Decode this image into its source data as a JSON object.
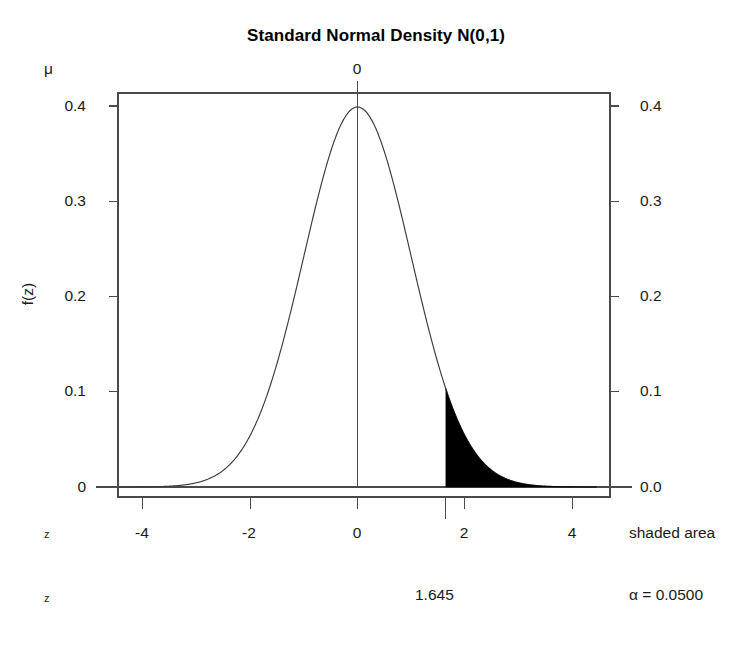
{
  "chart_data": {
    "type": "line",
    "title": "Standard Normal Density N(0,1)",
    "xlabel": "z",
    "ylabel": "f(z)",
    "xlim": [
      -4.45,
      4.45
    ],
    "ylim": [
      0,
      0.4303
    ],
    "grid": false,
    "legend": null,
    "distribution": {
      "name": "standard normal",
      "mean": 0,
      "sd": 1,
      "peak_density": 0.3989
    },
    "x_ticks": [
      -4,
      -2,
      0,
      2,
      4
    ],
    "x_tick_labels": [
      "-4",
      "-2",
      "0",
      "2",
      "4"
    ],
    "y_ticks_left": [
      0,
      0.1,
      0.2,
      0.3,
      0.4
    ],
    "y_tick_labels_left": [
      "0",
      "0.1",
      "0.2",
      "0.3",
      "0.4"
    ],
    "y_ticks_right": [
      0,
      0.1,
      0.2,
      0.3,
      0.4
    ],
    "y_tick_labels_right": [
      "0.0",
      "0.1",
      "0.2",
      "0.3",
      "0.4"
    ],
    "top_axis_ticks": [
      0
    ],
    "top_axis_tick_labels": [
      "0"
    ],
    "top_axis_name": "μ",
    "critical_value": 1.645,
    "critical_value_label": "1.645",
    "shaded_region": {
      "from": 1.645,
      "to": 4.45,
      "area": 0.05,
      "area_label": "α = 0.0500",
      "fill": "#000000",
      "label": "shaded area",
      "density_at_cut": 0.1031
    },
    "mean_line_at": 0,
    "curve_color": "#3a3a3a",
    "axis_color": "#4a4a4a"
  },
  "title": "Standard Normal Density N(0,1)",
  "axes": {
    "top_label": "μ",
    "top_tick_0": "0",
    "left_axis_label": "f(z)",
    "left_ticks": [
      "0.4",
      "0.3",
      "0.2",
      "0.1",
      "0"
    ],
    "right_ticks": [
      "0.4",
      "0.3",
      "0.2",
      "0.1",
      "0.0"
    ],
    "x_ticks": [
      "-4",
      "-2",
      "0",
      "2",
      "4"
    ],
    "x_row_left_label": "z",
    "x_row_right_label": "shaded area",
    "bottom_row_left_label": "z",
    "bottom_row_center_label": "1.645",
    "bottom_row_right_label": "α = 0.0500"
  }
}
